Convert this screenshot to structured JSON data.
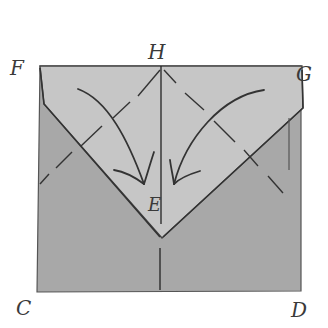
{
  "diagram": {
    "type": "origami-fold-diagram",
    "colors": {
      "paper_back": "#a9a9a9",
      "paper_flap": "#c4c4c4",
      "line": "#2e2e2e",
      "background": "#ffffff"
    },
    "labels": {
      "F": "F",
      "H": "H",
      "G": "G",
      "E": "E",
      "C": "C",
      "D": "D"
    },
    "elements": {
      "fold_arrows": [
        "left-arrow-to-center",
        "right-arrow-to-center"
      ],
      "crease_lines": [
        "vertical-center-crease",
        "left-diagonal-dashed",
        "right-diagonal-dashed"
      ]
    }
  }
}
